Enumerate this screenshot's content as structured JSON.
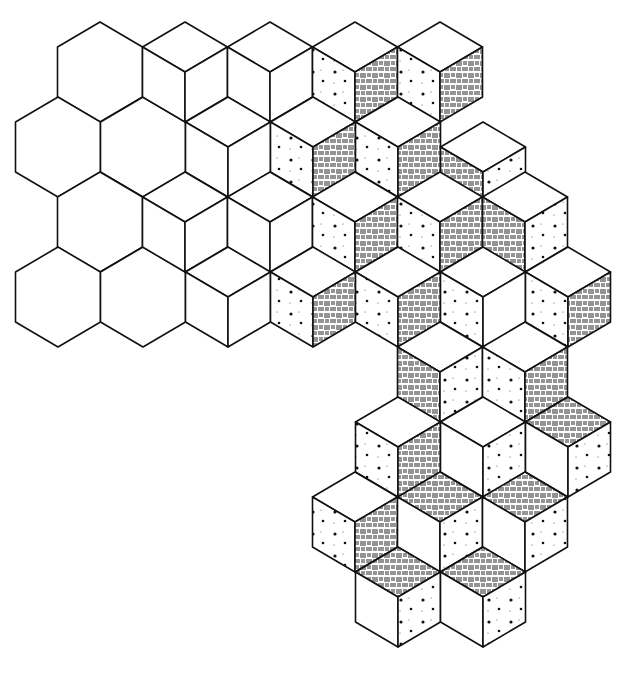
{
  "figure": {
    "title": "",
    "stroke_color": "#111111",
    "background": "#ffffff",
    "lattice": {
      "dx": 42.5,
      "dy": 25,
      "side": 50,
      "origin_x": 15,
      "origin_y": 22
    }
  },
  "hexagons": [
    {
      "cx": 100,
      "cy": 72
    },
    {
      "cx": 58,
      "cy": 147
    },
    {
      "cx": 143,
      "cy": 147
    },
    {
      "cx": 100,
      "cy": 222
    },
    {
      "cx": 58,
      "cy": 297
    },
    {
      "cx": 143,
      "cy": 297
    }
  ],
  "cubes": [
    {
      "cx": 185,
      "cy": 72,
      "left": "plain",
      "right": "plain",
      "top": "plain"
    },
    {
      "cx": 270,
      "cy": 72,
      "left": "plain",
      "right": "plain",
      "top": "plain"
    },
    {
      "cx": 355,
      "cy": 72,
      "left": "dots",
      "right": "hatch",
      "top": "plain"
    },
    {
      "cx": 440,
      "cy": 72,
      "left": "dots",
      "right": "hatch",
      "top": "plain"
    },
    {
      "cx": 228,
      "cy": 147,
      "left": "plain",
      "right": "plain",
      "top": "plain"
    },
    {
      "cx": 313,
      "cy": 147,
      "left": "dots",
      "right": "hatch",
      "top": "plain"
    },
    {
      "cx": 398,
      "cy": 147,
      "left": "dots",
      "right": "hatch",
      "top": "plain"
    },
    {
      "cx": 483,
      "cy": 172,
      "left": "hatch",
      "right": "dots",
      "top": "plain"
    },
    {
      "cx": 185,
      "cy": 222,
      "left": "plain",
      "right": "plain",
      "top": "plain"
    },
    {
      "cx": 270,
      "cy": 222,
      "left": "plain",
      "right": "plain",
      "top": "plain"
    },
    {
      "cx": 355,
      "cy": 222,
      "left": "dots",
      "right": "hatch",
      "top": "plain"
    },
    {
      "cx": 440,
      "cy": 222,
      "left": "dots",
      "right": "hatch",
      "top": "plain"
    },
    {
      "cx": 525,
      "cy": 222,
      "left": "hatch",
      "right": "dots",
      "top": "plain"
    },
    {
      "cx": 228,
      "cy": 297,
      "left": "plain",
      "right": "plain",
      "top": "plain"
    },
    {
      "cx": 313,
      "cy": 297,
      "left": "dots",
      "right": "hatch",
      "top": "plain"
    },
    {
      "cx": 398,
      "cy": 297,
      "left": "dots",
      "right": "hatch",
      "top": "plain"
    },
    {
      "cx": 483,
      "cy": 297,
      "left": "dots",
      "right": "plain",
      "top": "plain"
    },
    {
      "cx": 568,
      "cy": 297,
      "left": "dots",
      "right": "hatch",
      "top": "plain"
    },
    {
      "cx": 440,
      "cy": 372,
      "left": "hatch",
      "right": "dots",
      "top": "plain"
    },
    {
      "cx": 525,
      "cy": 372,
      "left": "dots",
      "right": "hatch",
      "top": "plain"
    },
    {
      "cx": 398,
      "cy": 447,
      "left": "dots",
      "right": "hatch",
      "top": "plain"
    },
    {
      "cx": 483,
      "cy": 447,
      "left": "plain",
      "right": "dots",
      "top": "plain"
    },
    {
      "cx": 568,
      "cy": 447,
      "left": "plain",
      "right": "dots",
      "top": "hatch"
    },
    {
      "cx": 355,
      "cy": 522,
      "left": "dots",
      "right": "hatch",
      "top": "plain"
    },
    {
      "cx": 440,
      "cy": 522,
      "left": "plain",
      "right": "dots",
      "top": "hatch"
    },
    {
      "cx": 525,
      "cy": 522,
      "left": "plain",
      "right": "dots",
      "top": "hatch"
    },
    {
      "cx": 398,
      "cy": 597,
      "left": "plain",
      "right": "dots",
      "top": "hatch"
    },
    {
      "cx": 483,
      "cy": 597,
      "left": "plain",
      "right": "dots",
      "top": "hatch"
    }
  ]
}
